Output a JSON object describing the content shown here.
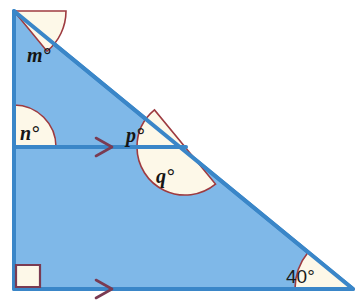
{
  "figure": {
    "colors": {
      "triangle_fill": "#7fb8e8",
      "triangle_stroke": "#3a86c8",
      "sector_fill": "#fdf8e8",
      "sector_stroke": "#9e3b40",
      "arrow_marker": "#7a3b52",
      "right_angle_stroke": "#7a3b52",
      "background": "#ffffff",
      "label_text": "#151515"
    },
    "geometry": {
      "vertex_top": [
        14,
        11
      ],
      "vertex_bottom_left": [
        14,
        289
      ],
      "vertex_bottom_right": [
        353,
        289
      ],
      "transversal_left": [
        14,
        147
      ],
      "transversal_right": [
        185,
        147
      ]
    }
  },
  "angles": [
    {
      "id": "angle-m",
      "label": "m°",
      "letter": "m",
      "style": "serif-italic",
      "vertex": "top",
      "position": [
        27,
        62
      ],
      "radius": 52,
      "start_deg": 0,
      "end_deg": 50.6
    },
    {
      "id": "angle-n",
      "label": "n°",
      "letter": "n",
      "style": "serif-italic",
      "vertex": "transversal-left",
      "position": [
        22,
        140
      ],
      "radius": 42,
      "start_deg": -90,
      "end_deg": 0
    },
    {
      "id": "angle-p",
      "label": "p°",
      "letter": "p",
      "style": "serif-italic",
      "vertex": "transversal-intersection",
      "position": [
        125,
        141
      ],
      "radius": 48,
      "start_deg": 180,
      "end_deg": 230.6
    },
    {
      "id": "angle-q",
      "label": "q°",
      "letter": "q",
      "style": "serif-italic",
      "vertex": "transversal-intersection",
      "position": [
        155,
        181
      ],
      "radius": 48,
      "start_deg": 50.6,
      "end_deg": 180
    },
    {
      "id": "angle-40",
      "label": "40°",
      "value": 40,
      "style": "sans-upright",
      "vertex": "bottom-right",
      "position": [
        286,
        281
      ],
      "radius": 58,
      "start_deg": 180,
      "end_deg": 219.4
    }
  ],
  "markers": {
    "right_angle": {
      "name": "right-angle-marker",
      "vertex": "bottom-left",
      "size": 24,
      "label": "right angle (90°)"
    },
    "parallel_arrows": [
      {
        "name": "parallel-arrow-transversal",
        "position": [
          104,
          147
        ],
        "direction": "right"
      },
      {
        "name": "parallel-arrow-base",
        "position": [
          104,
          289
        ],
        "direction": "right"
      }
    ]
  }
}
